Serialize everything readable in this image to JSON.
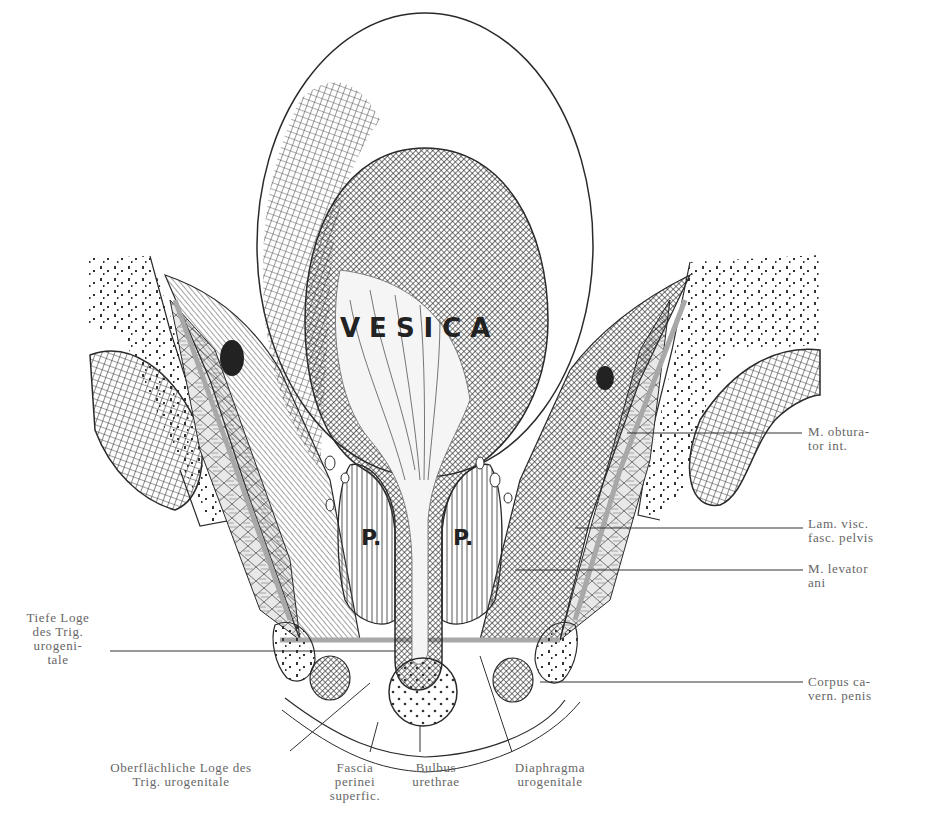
{
  "figure": {
    "type": "anatomical-illustration",
    "in_figure_labels": {
      "bladder": "VESICA",
      "prostate_left": "P.",
      "prostate_right": "P."
    }
  },
  "labels": {
    "right": [
      {
        "id": "obturator",
        "text": "M. obtura-\ntor int."
      },
      {
        "id": "lam_visc",
        "text": "Lam. visc.\nfasc. pelvis"
      },
      {
        "id": "levator",
        "text": "M. levator\nani"
      },
      {
        "id": "corpus",
        "text": "Corpus ca-\nvern. penis"
      }
    ],
    "left": [
      {
        "id": "tiefe_loge",
        "text": "Tiefe Loge\ndes Trig.\nurogeni-\ntale"
      }
    ],
    "bottom": [
      {
        "id": "oberfl_loge",
        "text": "Oberflächliche Loge des\nTrig. urogenitale"
      },
      {
        "id": "fascia",
        "text": "Fascia\nperinei\nsuperfic."
      },
      {
        "id": "bulbus",
        "text": "Bulbus\nurethrae"
      },
      {
        "id": "diaphragma",
        "text": "Diaphragma\nurogenitale"
      }
    ]
  },
  "colors": {
    "ink": "#2a2a2a",
    "fascia_gray": "#a8a8a8",
    "label_text": "#666666",
    "background": "#ffffff"
  }
}
